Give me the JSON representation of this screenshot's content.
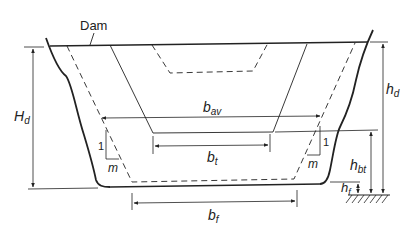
{
  "figure": {
    "type": "cross-section diagram",
    "colors": {
      "ink": "#222222",
      "background": "#ffffff"
    }
  },
  "labels": {
    "dam": "Dam",
    "H_d": {
      "main": "H",
      "sub": "d"
    },
    "h_d": {
      "main": "h",
      "sub": "d"
    },
    "b_av": {
      "main": "b",
      "sub": "av"
    },
    "b_t": {
      "main": "b",
      "sub": "t"
    },
    "b_f": {
      "main": "b",
      "sub": "f"
    },
    "h_bt": {
      "main": "h",
      "sub": "bt"
    },
    "h_f": {
      "main": "h",
      "sub": "f"
    },
    "slope_left": {
      "rise": "1",
      "run": "m"
    },
    "slope_right": {
      "rise": "1",
      "run": "m"
    }
  },
  "elements": {
    "water_surface": "Dam water level (top solid line)",
    "natural_banks": "Irregular natural channel banks (thick solid curves)",
    "flood_channel": "Dashed trapezoid: outer breach/flood channel with bottom width b_f",
    "top_channel": "Solid trapezoid: inner channel with bottom width b_t",
    "small_channel": "Dashed small trapezoid at top center",
    "ground_datum": "Hatched ground reference at bottom right"
  }
}
